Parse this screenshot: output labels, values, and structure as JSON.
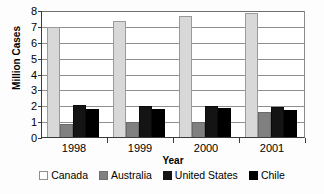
{
  "chart_data": {
    "type": "bar",
    "title": "",
    "subtitle": "",
    "xlabel": "Year",
    "ylabel": "Million Cases",
    "categories": [
      "1998",
      "1999",
      "2000",
      "2001"
    ],
    "series": [
      {
        "name": "Canada",
        "color": "#d8d8d8",
        "values": [
          6.95,
          7.3,
          7.6,
          7.8
        ]
      },
      {
        "name": "Australia",
        "color": "#808080",
        "values": [
          0.85,
          0.95,
          0.95,
          1.55
        ]
      },
      {
        "name": "United States",
        "color": "#141414",
        "values": [
          2.0,
          1.98,
          1.95,
          1.92
        ]
      },
      {
        "name": "Chile",
        "color": "#000000",
        "values": [
          1.78,
          1.75,
          1.82,
          1.72
        ]
      }
    ],
    "ylim": [
      0,
      8
    ],
    "yticks": [
      0,
      1,
      2,
      3,
      4,
      5,
      6,
      7,
      8
    ],
    "ytick_labels": [
      "0",
      "1",
      "2",
      "3",
      "4",
      "5",
      "6",
      "7",
      "8"
    ],
    "grid": true,
    "grid_axis": "y",
    "legend_position": "bottom",
    "legend_entries": [
      "Canada",
      "Australia",
      "United States",
      "Chile"
    ]
  }
}
